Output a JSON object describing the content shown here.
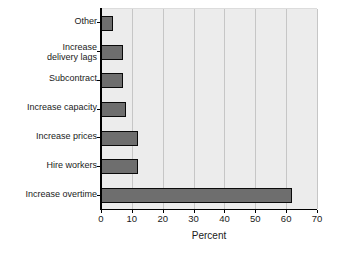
{
  "chart_data": {
    "type": "bar",
    "orientation": "horizontal",
    "title": "",
    "xlabel": "Percent",
    "ylabel": "",
    "xlim": [
      0,
      70
    ],
    "xticks": [
      0,
      10,
      20,
      30,
      40,
      50,
      60,
      70
    ],
    "grid": true,
    "legend": false,
    "categories": [
      "Other",
      "Increase\ndelivery lags",
      "Subcontract",
      "Increase capacity",
      "Increase prices",
      "Hire workers",
      "Increase overtime"
    ],
    "values": [
      4,
      7,
      7,
      8,
      12,
      12,
      62
    ],
    "series": [
      {
        "name": "Percent",
        "values": [
          4,
          7,
          7,
          8,
          12,
          12,
          62
        ]
      }
    ],
    "colors": {
      "bar_fill": "#6e6e6e",
      "bar_edge": "#0a0a0a",
      "plot_background": "#ececec",
      "gridline": "#c6c6c6",
      "axis": "#000000",
      "text": "#1a1a1a",
      "figure_background": "#ffffff"
    }
  }
}
